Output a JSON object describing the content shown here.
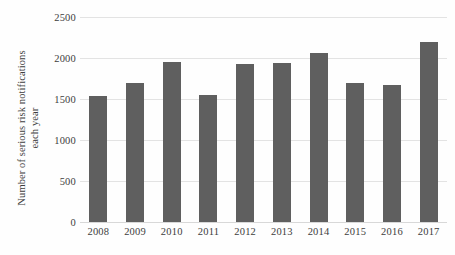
{
  "chart_data": {
    "type": "bar",
    "title": "",
    "subtitle": "",
    "xlabel": "",
    "ylabel": "Number of serious risk notifications each year",
    "ylabel_line1": "Number of serious risk notifications",
    "ylabel_line2": "each year",
    "categories": [
      "2008",
      "2009",
      "2010",
      "2011",
      "2012",
      "2013",
      "2014",
      "2015",
      "2016",
      "2017"
    ],
    "values": [
      1540,
      1690,
      1950,
      1545,
      1925,
      1945,
      2060,
      1690,
      1675,
      2190
    ],
    "series": [
      {
        "name": "Serious risk notifications",
        "values": [
          1540,
          1690,
          1950,
          1545,
          1925,
          1945,
          2060,
          1690,
          1675,
          2190
        ]
      }
    ],
    "ylim": [
      0,
      2500
    ],
    "y_ticks": [
      0,
      500,
      1000,
      1500,
      2000,
      2500
    ],
    "y_tick_labels": [
      "0",
      "500",
      "1000",
      "1500",
      "2000",
      "2500"
    ],
    "grid": "horizontal",
    "legend": "none",
    "bar_color": "#5f5f5f",
    "gridline_color": "#e3e3e3",
    "background_color": "#ffffff",
    "text_color": "#3d3d3d"
  }
}
